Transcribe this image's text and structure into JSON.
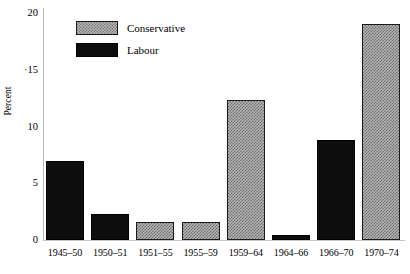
{
  "chart_data": {
    "type": "bar",
    "title": "",
    "subtitle": "",
    "xlabel": "",
    "ylabel": "Percent",
    "ylim": [
      0,
      20
    ],
    "yticks": [
      0,
      5,
      10,
      15,
      20
    ],
    "ytick_labels": [
      "0",
      "5",
      "10",
      "·15",
      "20"
    ],
    "grid": false,
    "legend_position": "top-left",
    "categories": [
      "1945–50",
      "1950–51",
      "1951–55",
      "1955–59",
      "1959–64",
      "1964–66",
      "1966–70",
      "1970–74"
    ],
    "values": [
      7.0,
      2.3,
      1.6,
      1.6,
      12.3,
      0.4,
      8.8,
      19.0
    ],
    "bar_party": [
      "Labour",
      "Labour",
      "Conservative",
      "Conservative",
      "Conservative",
      "Labour",
      "Labour",
      "Conservative"
    ],
    "series": [
      {
        "name": "Conservative",
        "color": "#b4b4b4",
        "pattern": "checkered-hatch",
        "points": [
          {
            "category": "1951–55",
            "value": 1.6
          },
          {
            "category": "1955–59",
            "value": 1.6
          },
          {
            "category": "1959–64",
            "value": 12.3
          },
          {
            "category": "1970–74",
            "value": 19.0
          }
        ]
      },
      {
        "name": "Labour",
        "color": "#0d0d0d",
        "pattern": "solid",
        "points": [
          {
            "category": "1945–50",
            "value": 7.0
          },
          {
            "category": "1950–51",
            "value": 2.3
          },
          {
            "category": "1964–66",
            "value": 0.4
          },
          {
            "category": "1966–70",
            "value": 8.8
          }
        ]
      }
    ]
  },
  "legend": {
    "items": [
      {
        "label": "Conservative",
        "party": "conservative"
      },
      {
        "label": "Labour",
        "party": "labour"
      }
    ]
  },
  "axes": {
    "y_title": "Percent"
  }
}
